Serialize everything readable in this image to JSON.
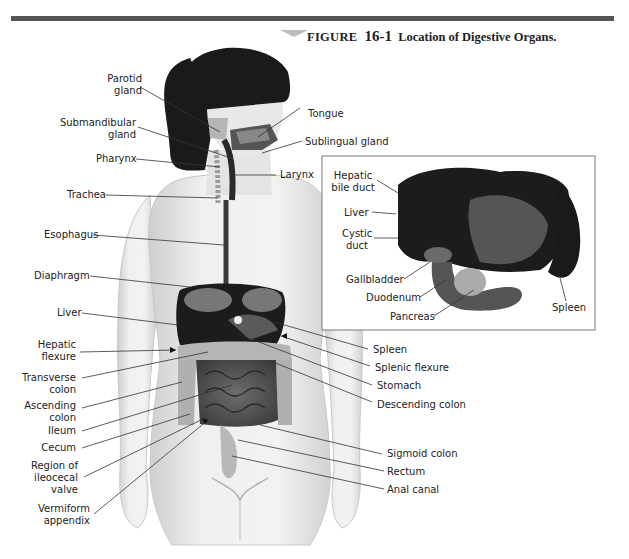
{
  "figure": {
    "label": "FIGURE",
    "number": "16-1",
    "title": "Location of Digestive Organs."
  },
  "labels_left": {
    "parotid_gland": [
      "Parotid",
      "gland"
    ],
    "submandibular_gland": [
      "Submandibular",
      "gland"
    ],
    "pharynx": "Pharynx",
    "trachea": "Trachea",
    "esophagus": "Esophagus",
    "diaphragm": "Diaphragm",
    "liver": "Liver",
    "hepatic_flexure": [
      "Hepatic",
      "flexure"
    ],
    "transverse_colon": [
      "Transverse",
      "colon"
    ],
    "ascending_colon": [
      "Ascending",
      "colon"
    ],
    "ileum": "Ileum",
    "cecum": "Cecum",
    "ileocecal_valve": [
      "Region of",
      "ileocecal",
      "valve"
    ],
    "vermiform_appendix": [
      "Vermiform",
      "appendix"
    ]
  },
  "labels_right": {
    "tongue": "Tongue",
    "sublingual_gland": "Sublingual gland",
    "larynx": "Larynx",
    "spleen": "Spleen",
    "splenic_flexure": "Splenic flexure",
    "stomach": "Stomach",
    "descending_colon": "Descending colon",
    "sigmoid_colon": "Sigmoid colon",
    "rectum": "Rectum",
    "anal_canal": "Anal canal"
  },
  "inset": {
    "hepatic_bile_duct": [
      "Hepatic",
      "bile duct"
    ],
    "liver": "Liver",
    "cystic_duct": [
      "Cystic",
      "duct"
    ],
    "gallbladder": "Gallbladder",
    "duodenum": "Duodenum",
    "pancreas": "Pancreas",
    "spleen": "Spleen"
  },
  "colors": {
    "bar": "#555555",
    "hair": "#1a1a1a",
    "skin": "#e6e6e6",
    "organ_dark": "#1c1c1c",
    "organ_mid": "#6a6a6a",
    "organ_light": "#b8b8b8",
    "leader": "#333333"
  }
}
